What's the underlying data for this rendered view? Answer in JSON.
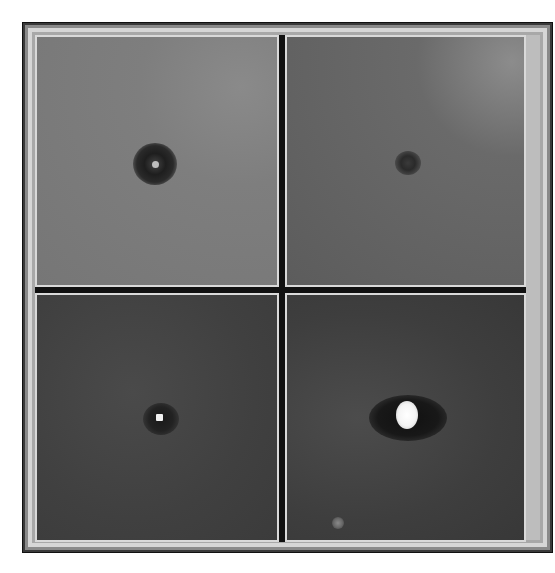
{
  "figure": {
    "layout": "2x2 grid of grayscale image panels",
    "panels": [
      {
        "id": "top-left",
        "description": "Dark ring-shaped spot with bright center on mid-gray background"
      },
      {
        "id": "top-right",
        "description": "Small faint dark spot on darker gray background, bright corner upper right"
      },
      {
        "id": "bottom-left",
        "description": "Small bright point with dark halo on dark noisy background"
      },
      {
        "id": "bottom-right",
        "description": "Large bright blob with dark halo, faint secondary spot near bottom-left"
      }
    ]
  },
  "colors": {
    "frame_light": "#d6d6d6",
    "frame_dark": "#2a2a2a",
    "divider": "#111111"
  }
}
